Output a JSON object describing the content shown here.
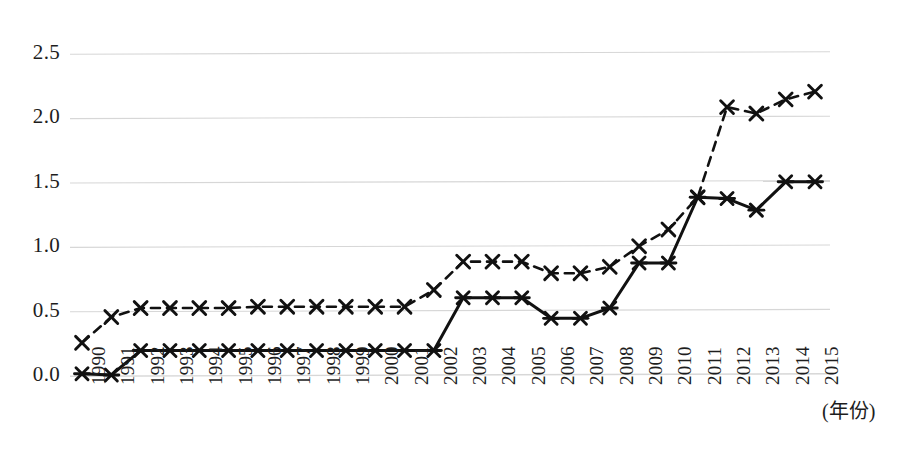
{
  "chart_data": {
    "type": "line",
    "title": "",
    "subtitle": "",
    "xlabel": "(年份)",
    "ylabel": "",
    "grid": true,
    "legend_position": "none",
    "xlim": [
      1990,
      2015
    ],
    "ylim": [
      0.0,
      2.5
    ],
    "categories": [
      "1990",
      "1991",
      "1992",
      "1993",
      "1994",
      "1995",
      "1996",
      "1997",
      "1998",
      "1999",
      "2000",
      "2001",
      "2002",
      "2003",
      "2004",
      "2005",
      "2006",
      "2007",
      "2008",
      "2009",
      "2010",
      "2011",
      "2012",
      "2013",
      "2014",
      "2015"
    ],
    "x_tick_labels": [
      "1990",
      "1991",
      "1992",
      "1993",
      "1994",
      "1995",
      "1996",
      "1997",
      "1998",
      "1999",
      "2000",
      "2001",
      "2002",
      "2003",
      "2004",
      "2005",
      "2006",
      "2007",
      "2008",
      "2009",
      "2010",
      "2011",
      "2012",
      "2013",
      "2014",
      "2015"
    ],
    "y_tick_labels": [
      "0.0",
      "0.5",
      "1.0",
      "1.5",
      "2.0",
      "2.5"
    ],
    "y_ticks": [
      0.0,
      0.5,
      1.0,
      1.5,
      2.0,
      2.5
    ],
    "series": [
      {
        "name": "dashed-series",
        "marker": "x",
        "line_style": "dashed",
        "color": "#111111",
        "values": [
          0.25,
          0.45,
          0.52,
          0.52,
          0.52,
          0.52,
          0.53,
          0.53,
          0.53,
          0.53,
          0.53,
          0.53,
          0.66,
          0.88,
          0.88,
          0.88,
          0.79,
          0.79,
          0.84,
          1.0,
          1.13,
          1.38,
          2.08,
          2.03,
          2.14,
          2.2
        ]
      },
      {
        "name": "solid-series",
        "marker": "asterisk",
        "line_style": "solid",
        "color": "#111111",
        "values": [
          0.01,
          0.0,
          0.19,
          0.19,
          0.19,
          0.19,
          0.19,
          0.19,
          0.19,
          0.19,
          0.19,
          0.19,
          0.19,
          0.6,
          0.6,
          0.6,
          0.44,
          0.44,
          0.52,
          0.87,
          0.87,
          1.38,
          1.37,
          1.28,
          1.5,
          1.5
        ]
      }
    ]
  },
  "axis": {
    "x_title": "(年份)"
  }
}
